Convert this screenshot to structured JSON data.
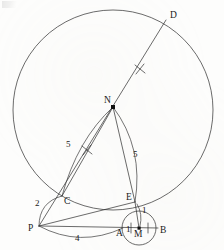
{
  "figure": {
    "corner_mark": "",
    "points": [
      {
        "id": "D",
        "label": "D",
        "x": 166,
        "y": 20,
        "label_x": 170,
        "label_y": 18,
        "dot": false
      },
      {
        "id": "N",
        "label": "N",
        "x": 113,
        "y": 107,
        "label_x": 104,
        "label_y": 103,
        "dot": true
      },
      {
        "id": "C",
        "label": "C",
        "x": 62,
        "y": 196,
        "label_x": 64,
        "label_y": 204,
        "dot": false
      },
      {
        "id": "E",
        "label": "E",
        "x": 135,
        "y": 202,
        "label_x": 128,
        "label_y": 200,
        "dot": false
      },
      {
        "id": "P",
        "label": "P",
        "x": 39,
        "y": 226,
        "label_x": 29,
        "label_y": 231,
        "dot": false
      },
      {
        "id": "A",
        "label": "A",
        "x": 123,
        "y": 228,
        "label_x": 116,
        "label_y": 235,
        "dot": false
      },
      {
        "id": "M",
        "label": "M",
        "x": 139,
        "y": 228,
        "label_x": 136,
        "label_y": 236,
        "dot": true
      },
      {
        "id": "B",
        "label": "B",
        "x": 156,
        "y": 228,
        "label_x": 160,
        "label_y": 232,
        "dot": false
      }
    ],
    "length_labels": [
      {
        "id": "len-NC",
        "text": "5",
        "x": 69,
        "y": 145
      },
      {
        "id": "len-NE",
        "text": "5",
        "x": 136,
        "y": 155
      },
      {
        "id": "len-PC",
        "text": "2",
        "x": 40,
        "y": 203
      },
      {
        "id": "len-PA",
        "text": "4",
        "x": 78,
        "y": 239
      },
      {
        "id": "len-EM",
        "text": "1",
        "x": 141,
        "y": 212
      },
      {
        "id": "len-AM",
        "text": "1",
        "x": 129,
        "y": 232
      }
    ],
    "circles": [
      {
        "id": "large-circle",
        "cx": 113,
        "cy": 110,
        "r": 100
      },
      {
        "id": "small-circle",
        "cx": 139,
        "cy": 228,
        "r": 17
      }
    ],
    "segments": [
      {
        "id": "seg-PD",
        "from": "P",
        "to": "D"
      },
      {
        "id": "seg-NE",
        "from": "N",
        "to": "E"
      },
      {
        "id": "seg-PE",
        "from": "P",
        "to": "E"
      },
      {
        "id": "seg-PB",
        "from": "P",
        "to": "B"
      }
    ],
    "arcs": [
      {
        "id": "arc-NC",
        "label": "5"
      },
      {
        "id": "arc-NE",
        "label": "5"
      },
      {
        "id": "arc-PC",
        "label": "2"
      },
      {
        "id": "arc-PA",
        "label": "4"
      },
      {
        "id": "arc-EM",
        "label": "1"
      }
    ],
    "tick_marks": [
      {
        "id": "tick-NC",
        "style": "cross",
        "x": 87,
        "y": 150
      },
      {
        "id": "tick-ND",
        "style": "cross",
        "x": 140,
        "y": 69
      },
      {
        "id": "tick-AM",
        "style": "bar",
        "x": 131,
        "y": 228
      },
      {
        "id": "tick-MB",
        "style": "bar",
        "x": 148,
        "y": 228
      }
    ],
    "colors": {
      "ink": "#2b2b2b",
      "paper": "#fdfdfc"
    }
  }
}
